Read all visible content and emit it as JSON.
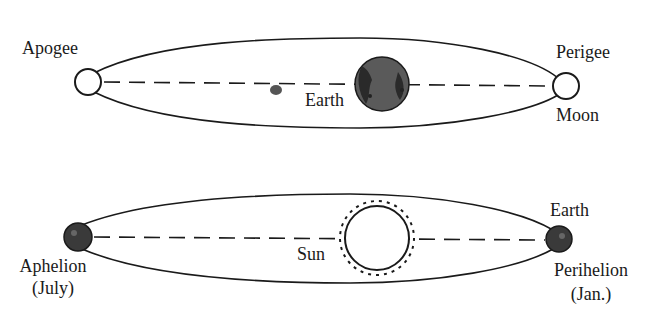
{
  "diagram": {
    "top": {
      "name": "Moon orbit around Earth",
      "labels": {
        "apogee": "Apogee",
        "perigee": "Perigee",
        "earth": "Earth",
        "moon": "Moon"
      }
    },
    "bottom": {
      "name": "Earth orbit around Sun",
      "labels": {
        "sun": "Sun",
        "earth": "Earth",
        "aphelion": "Aphelion",
        "aphelion_month": "(July)",
        "perihelion": "Perihelion",
        "perihelion_month": "(Jan.)"
      }
    },
    "colors": {
      "line": "#1a1a1a",
      "earth_fill": "#555555",
      "earth_dark": "#2a2a2a",
      "background": "#ffffff"
    }
  }
}
